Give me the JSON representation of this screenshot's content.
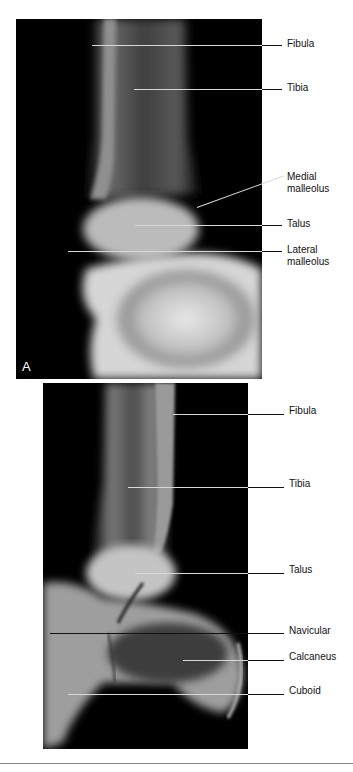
{
  "figure": {
    "panels": [
      {
        "id": "A",
        "view": "anteroposterior ankle radiograph",
        "panel_letter": "A",
        "labels": [
          {
            "text": "Fibula"
          },
          {
            "text": "Tibia"
          },
          {
            "text": "Medial\nmalleolus",
            "line1": "Medial",
            "line2": "malleolus"
          },
          {
            "text": "Talus"
          },
          {
            "text": "Lateral\nmalleolus",
            "line1": "Lateral",
            "line2": "malleolus"
          }
        ]
      },
      {
        "id": "B",
        "view": "lateral ankle radiograph",
        "labels": [
          {
            "text": "Fibula"
          },
          {
            "text": "Tibia"
          },
          {
            "text": "Talus"
          },
          {
            "text": "Navicular"
          },
          {
            "text": "Calcaneus"
          },
          {
            "text": "Cuboid"
          }
        ]
      }
    ]
  }
}
